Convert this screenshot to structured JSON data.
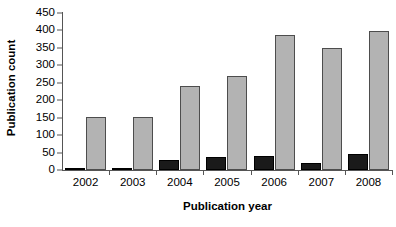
{
  "chart_data": {
    "type": "bar",
    "title": "",
    "xlabel": "Publication year",
    "ylabel": "Publication count",
    "categories": [
      "2002",
      "2003",
      "2004",
      "2005",
      "2006",
      "2007",
      "2008"
    ],
    "series": [
      {
        "name": "series-black",
        "color": "#1a1a1a",
        "values": [
          5,
          4,
          28,
          36,
          41,
          20,
          45
        ]
      },
      {
        "name": "series-gray",
        "color": "#b3b3b3",
        "values": [
          151,
          153,
          242,
          270,
          387,
          350,
          398
        ]
      }
    ],
    "ylim": [
      0,
      450
    ],
    "yticks": [
      0,
      50,
      100,
      150,
      200,
      250,
      300,
      350,
      400,
      450
    ],
    "ytick_labels": [
      "0",
      "50",
      "100",
      "150",
      "200",
      "250",
      "300",
      "350",
      "400",
      "450"
    ],
    "grid": false,
    "legend": "none"
  }
}
